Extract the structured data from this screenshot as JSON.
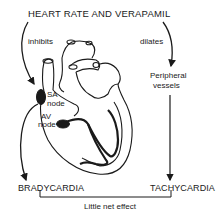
{
  "diagram": {
    "title": "HEART RATE AND VERAPAMIL",
    "left_arrow_label": "inhibits",
    "right_arrow_label": "dilates",
    "sa_node_line1": "SA",
    "sa_node_line2": "node",
    "av_node_line1": "AV",
    "av_node_line2": "node",
    "peripheral_line1": "Peripheral",
    "peripheral_line2": "vessels",
    "left_outcome": "BRADYCARDIA",
    "right_outcome": "TACHYCARDIA",
    "net_effect": "Little net effect",
    "colors": {
      "ink": "#1a1a1a",
      "background": "#ffffff"
    }
  }
}
